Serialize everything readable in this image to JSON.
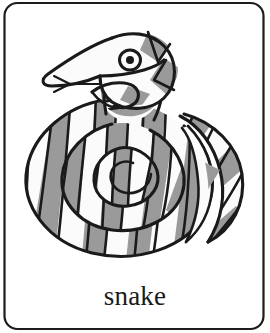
{
  "card": {
    "label": "snake",
    "illustration_name": "coiled-snake-drawing",
    "border_color": "#1c1c1c",
    "background_color": "#ffffff",
    "ink_color": "#1a1a1a",
    "band_gray": "#9a9a9a",
    "band_white": "#fbfbfb",
    "corner_radius_px": 12
  }
}
